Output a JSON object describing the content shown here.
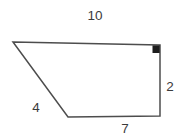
{
  "figure": {
    "type": "quadrilateral-diagram",
    "background_color": "#ffffff",
    "stroke_color": "#4d4d4d",
    "text_color": "#3b3b3b",
    "polygon_points": "13,42 160,45 160,116 68,117",
    "right_angle_marker": {
      "corner": "top-right",
      "color": "#1d1d1d",
      "path": "M152.5 45.4 h7.2 v7.6 h-7.2 Z"
    },
    "sides": [
      {
        "name": "top",
        "label": "10"
      },
      {
        "name": "right",
        "label": "2"
      },
      {
        "name": "bottom",
        "label": "7"
      },
      {
        "name": "left",
        "label": "4"
      }
    ]
  }
}
